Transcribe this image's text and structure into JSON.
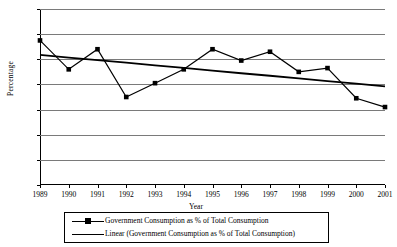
{
  "chart_data": {
    "type": "line",
    "title": "",
    "xlabel": "Year",
    "ylabel": "Percentage",
    "categories": [
      "1989",
      "1990",
      "1991",
      "1992",
      "1993",
      "1994",
      "1995",
      "1996",
      "1997",
      "1998",
      "1999",
      "2000",
      "2001"
    ],
    "x": [
      1989,
      1990,
      1991,
      1992,
      1993,
      1994,
      1995,
      1996,
      1997,
      1998,
      1999,
      2000,
      2001
    ],
    "series": [
      {
        "name": "Government Consumption as % of Total Consumption",
        "type": "line-marker",
        "marker": "square",
        "color": "#000000",
        "values": [
          27.5,
          25.2,
          26.8,
          23.0,
          24.1,
          25.2,
          26.8,
          25.9,
          26.6,
          25.0,
          25.3,
          22.9,
          22.2
        ]
      },
      {
        "name": "Linear (Government Consumption as % of Total Consumption)",
        "type": "trendline",
        "color": "#000000",
        "values": [
          26.35,
          26.14,
          25.93,
          25.73,
          25.52,
          25.31,
          25.1,
          24.89,
          24.69,
          24.48,
          24.27,
          24.06,
          23.85
        ]
      }
    ],
    "ylim": [
      16,
      30
    ],
    "yticks": [
      16,
      18,
      20,
      22,
      24,
      26,
      28,
      30
    ],
    "ytick_labels": [
      "16",
      "18",
      "20",
      "22",
      "24",
      "26",
      "28",
      "30"
    ],
    "grid": "horizontal",
    "legend_position": "bottom",
    "legend": [
      "Government Consumption as % of Total Consumption",
      "Linear (Government Consumption as % of Total Consumption)"
    ],
    "gridline_color": "#7a7a7a",
    "axis_color": "#000000",
    "background": "#ffffff"
  }
}
